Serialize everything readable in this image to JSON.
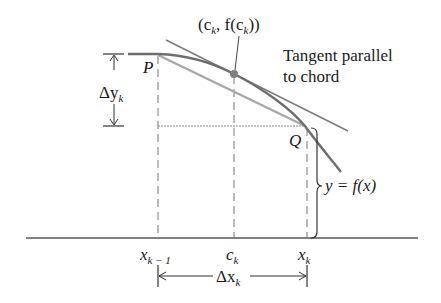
{
  "diagram": {
    "labels": {
      "point_c": "(c",
      "point_c_sub": "k",
      "point_c_mid": ", f(c",
      "point_c_sub2": "k",
      "point_c_end": "))",
      "tangent_line1": "Tangent parallel",
      "tangent_line2": "to chord",
      "P": "P",
      "Q": "Q",
      "delta_y": "Δy",
      "delta_y_sub": "k",
      "function": "y = f(x)",
      "x_prev": "x",
      "x_prev_sub": "k − 1",
      "c": "c",
      "c_sub": "k",
      "x_curr": "x",
      "x_curr_sub": "k",
      "delta_x": "Δx",
      "delta_x_sub": "k"
    },
    "colors": {
      "curve": "#6e6e6e",
      "tangent": "#7a7a7a",
      "chord": "#a8a8a8",
      "axis": "#555555",
      "text": "#1a1a1a"
    }
  }
}
